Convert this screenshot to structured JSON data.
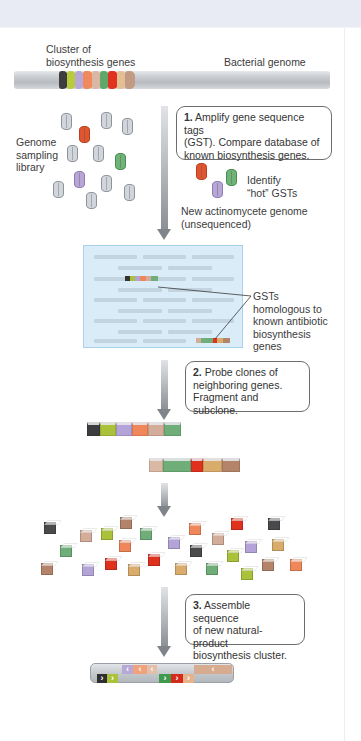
{
  "figure": {
    "labels": {
      "cluster": "Cluster of\nbiosynthesis genes",
      "cluster_line1": "Cluster of",
      "cluster_line2": "biosynthesis genes",
      "bacterial_genome": "Bacterial genome",
      "library_line1": "Genome",
      "library_line2": "sampling",
      "library_line3": "library",
      "identify_line1": "Identify",
      "identify_line2": "“hot” GSTs",
      "new_genome_line1": "New actinomycete genome",
      "new_genome_line2": "(unsequenced)",
      "gst_line1": "GSTs",
      "gst_line2": "homologous to",
      "gst_line3": "known antibiotic",
      "gst_line4": "biosynthesis",
      "gst_line5": "genes"
    },
    "steps": [
      {
        "number": "1.",
        "line1": " Amplify gene sequence tags",
        "line2": "(GST). Compare database of",
        "line3": "known biosynthesis genes."
      },
      {
        "number": "2.",
        "line1": " Probe clones of",
        "line2": "neighboring genes.",
        "line3": "Fragment and subclone."
      },
      {
        "number": "3.",
        "line1": " Assemble sequence",
        "line2": "of new natural-product",
        "line3": "biosynthesis cluster."
      }
    ],
    "gene_colors": {
      "black": "#3d3d3f",
      "lime": "#a9c23a",
      "lavender": "#b3a3d6",
      "salmon": "#f0875a",
      "tan": "#d4ad9a",
      "green": "#6fae78",
      "red": "#e0301e",
      "sand": "#d9ac6c",
      "brown": "#b38469",
      "gray": "#c9cdd2"
    },
    "background": {
      "top_band": "#e9ebf4",
      "panel": "#d9ecf8"
    }
  }
}
